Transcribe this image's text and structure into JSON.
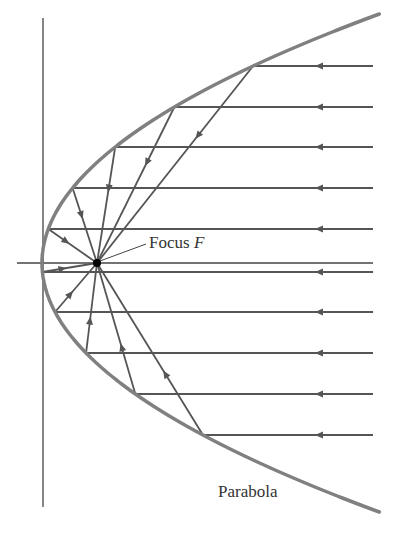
{
  "diagram": {
    "labels": {
      "focus_text": "Focus ",
      "focus_symbol": "F",
      "curve": "Parabola"
    },
    "colors": {
      "curve": "#808080",
      "rays": "#555555",
      "axes": "#444444",
      "focus": "#000000"
    },
    "geometry": {
      "vertex": [
        42,
        263
      ],
      "focus": [
        97,
        263
      ],
      "k": 0.00544,
      "directrix_x": 43,
      "directrix_y": [
        18,
        507
      ],
      "axis_y": 263,
      "axis_x": [
        17,
        373
      ],
      "ray_end_x": 373,
      "ray_ys": [
        66,
        107,
        147,
        188,
        229,
        272,
        312,
        353,
        394,
        435
      ],
      "curve_y_range": [
        14,
        513
      ]
    }
  }
}
